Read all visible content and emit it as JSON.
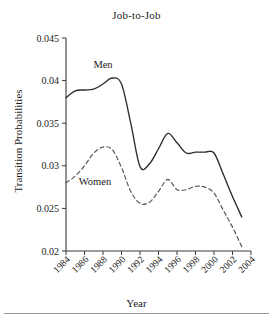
{
  "chart_data": {
    "type": "line",
    "title": "Job-to-Job",
    "xlabel": "Year",
    "ylabel": "Transition Probabilities",
    "grid": false,
    "legend_position": "inline-annotation",
    "xlim": [
      1984,
      2004
    ],
    "ylim": [
      0.02,
      0.045
    ],
    "xticks": [
      1984,
      1986,
      1988,
      1990,
      1992,
      1994,
      1996,
      1998,
      2000,
      2002,
      2004
    ],
    "xtick_labels": [
      "1984",
      "1986",
      "1988",
      "1990",
      "1992",
      "1994",
      "1996",
      "1998",
      "2000",
      "2002",
      "2004"
    ],
    "yticks": [
      0.02,
      0.025,
      0.03,
      0.035,
      0.04,
      0.045
    ],
    "ytick_labels": [
      "0.02",
      "0.025",
      "0.03",
      "0.035",
      "0.04",
      "0.045"
    ],
    "x": [
      1984,
      1985,
      1986,
      1987,
      1988,
      1989,
      1990,
      1991,
      1992,
      1993,
      1994,
      1995,
      1996,
      1997,
      1998,
      1999,
      2000,
      2001,
      2002,
      2003
    ],
    "series": [
      {
        "name": "Men",
        "style": "solid",
        "color": "#2b2b2b",
        "annotation": "Men",
        "values": [
          0.038,
          0.0388,
          0.0389,
          0.039,
          0.0396,
          0.0403,
          0.0396,
          0.035,
          0.0299,
          0.0302,
          0.032,
          0.0338,
          0.0327,
          0.0315,
          0.0316,
          0.0316,
          0.0315,
          0.029,
          0.0264,
          0.024
        ]
      },
      {
        "name": "Women",
        "style": "dashed",
        "color": "#585858",
        "annotation": "Women",
        "values": [
          0.028,
          0.0288,
          0.03,
          0.0315,
          0.0322,
          0.0319,
          0.0298,
          0.027,
          0.0256,
          0.0257,
          0.027,
          0.0284,
          0.0272,
          0.0272,
          0.0276,
          0.0275,
          0.0268,
          0.0248,
          0.0228,
          0.0205
        ]
      }
    ]
  }
}
